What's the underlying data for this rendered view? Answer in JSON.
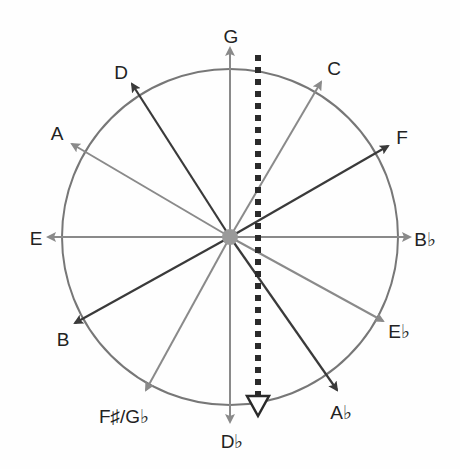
{
  "diagram": {
    "center": {
      "x": 230,
      "y": 237
    },
    "circle_radius": 168,
    "colors": {
      "circle": "#777777",
      "dark_arrow": "#3a3a3a",
      "light_arrow": "#8a8a8a",
      "center_dot": "#9a9a9a",
      "dotted_axis": "#2a2a2a",
      "label": "#222222"
    },
    "arrows": [
      {
        "note": "G",
        "tip": [
          230,
          48
        ],
        "label_pos": [
          231,
          36
        ],
        "tone": "light"
      },
      {
        "note": "C",
        "tip": [
          321,
          82
        ],
        "label_pos": [
          334,
          68
        ],
        "tone": "light"
      },
      {
        "note": "F",
        "tip": [
          388,
          146
        ],
        "label_pos": [
          402,
          137
        ],
        "tone": "dark"
      },
      {
        "note": "B♭",
        "tip": [
          410,
          237
        ],
        "label_pos": [
          425,
          239
        ],
        "tone": "light"
      },
      {
        "note": "E♭",
        "tip": [
          383,
          321
        ],
        "label_pos": [
          399,
          331
        ],
        "tone": "light"
      },
      {
        "note": "A♭",
        "tip": [
          337,
          390
        ],
        "label_pos": [
          341,
          412
        ],
        "tone": "dark"
      },
      {
        "note": "D♭",
        "tip": [
          230,
          422
        ],
        "label_pos": [
          232,
          441
        ],
        "tone": "light"
      },
      {
        "note": "F♯/G♭",
        "tip": [
          146,
          390
        ],
        "label_pos": [
          124,
          416
        ],
        "tone": "light"
      },
      {
        "note": "B",
        "tip": [
          75,
          323
        ],
        "label_pos": [
          63,
          339
        ],
        "tone": "dark"
      },
      {
        "note": "E",
        "tip": [
          48,
          237
        ],
        "label_pos": [
          36,
          238
        ],
        "tone": "light"
      },
      {
        "note": "A",
        "tip": [
          72,
          144
        ],
        "label_pos": [
          57,
          133
        ],
        "tone": "light"
      },
      {
        "note": "D",
        "tip": [
          132,
          84
        ],
        "label_pos": [
          121,
          72
        ],
        "tone": "dark"
      }
    ],
    "labels": {
      "G": "G",
      "C": "C",
      "F": "F",
      "Bb": "B♭",
      "Eb": "E♭",
      "Ab": "A♭",
      "Db": "D♭",
      "FsGb": "F♯/G♭",
      "B": "B",
      "E": "E",
      "A": "A",
      "D": "D"
    },
    "dotted_axis": {
      "x": 258,
      "y_start": 55,
      "y_end": 392,
      "arrowhead": "hollow-triangle-down",
      "arrow_tip_y": 417
    }
  }
}
